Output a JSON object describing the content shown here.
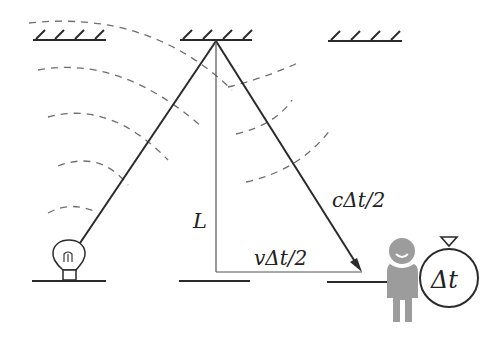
{
  "diagram": {
    "labels": {
      "vertical_distance": "L",
      "hypotenuse": "cΔt/2",
      "horizontal_displacement": "vΔt/2",
      "stopwatch_reading": "Δt"
    },
    "elements": {
      "mirrors_top_count": 3,
      "floor_segments_count": 3,
      "light_source": "light bulb",
      "observer": "person with stopwatch",
      "wavefronts": "dashed circular arcs centered on bulb"
    },
    "colors": {
      "line": "#2a2a2a",
      "dashed_wave": "#6a6a6a",
      "person": "#9a9a9a",
      "background": "#ffffff"
    }
  }
}
